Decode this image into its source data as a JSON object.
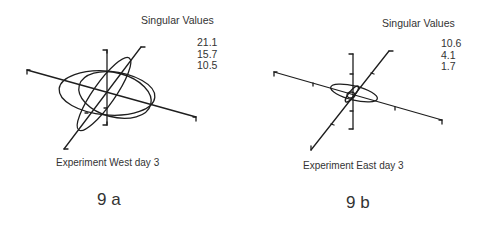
{
  "figures": [
    {
      "id": "9a",
      "label": "9 a",
      "caption": "Experiment West day 3",
      "singular_values_title": "Singular Values",
      "singular_values": [
        "21.1",
        "15.7",
        "10.5"
      ]
    },
    {
      "id": "9b",
      "label": "9 b",
      "caption": "Experiment East day 3",
      "singular_values_title": "Singular Values",
      "singular_values": [
        "10.6",
        "4.1",
        "1.7"
      ]
    }
  ],
  "colors": {
    "line": "#1e1e1e",
    "text": "#333333",
    "background": "#ffffff"
  }
}
